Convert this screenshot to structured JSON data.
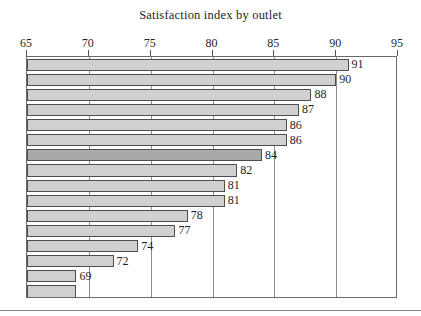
{
  "chart_data": {
    "type": "bar",
    "orientation": "horizontal",
    "title": "Satisfaction index by outlet",
    "xlabel": "",
    "ylabel": "",
    "xlim": [
      65,
      95
    ],
    "xticks": [
      65,
      70,
      75,
      80,
      85,
      90,
      95
    ],
    "xtick_labels": [
      "65",
      "70",
      "75",
      "80",
      "85",
      "90",
      "95"
    ],
    "grid": true,
    "grid_axis": "x",
    "legend": "none",
    "categories": [
      "1",
      "2",
      "3",
      "4",
      "5",
      "6",
      "7",
      "8",
      "9",
      "10",
      "11",
      "12",
      "13",
      "14",
      "15",
      "16"
    ],
    "values": [
      91,
      90,
      88,
      87,
      86,
      86,
      84,
      82,
      81,
      81,
      78,
      77,
      74,
      72,
      69,
      69
    ],
    "bar_labels": [
      "91",
      "90",
      "88",
      "87",
      "86",
      "86",
      "84",
      "82",
      "81",
      "81",
      "78",
      "77",
      "74",
      "72",
      "69",
      ""
    ],
    "highlighted_index": 6,
    "colors": {
      "bar_fill": "#d0d0d0",
      "bar_highlight_fill": "#a9a9a9",
      "bar_border": "#4d4d4d",
      "axis": "#5a5a5a",
      "grid": "#8d8d8d",
      "text": "#1f1f1f",
      "background": "#ffffff"
    }
  }
}
